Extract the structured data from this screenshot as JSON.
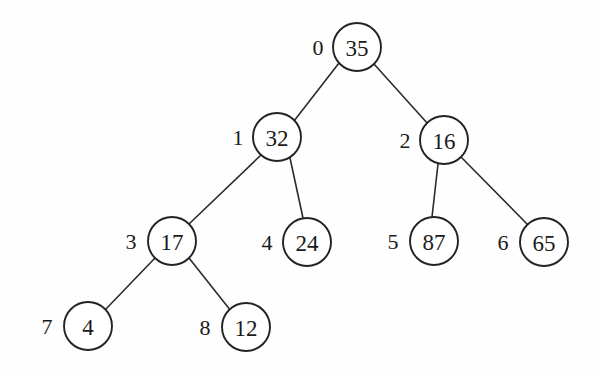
{
  "diagram": {
    "type": "binary-tree",
    "background_color": "#fefefe",
    "node_fill": "#ffffff",
    "node_stroke": "#232323",
    "edge_stroke": "#2b2b2b",
    "text_color": "#1a1a1a",
    "node_radius": 24
  },
  "nodes": [
    {
      "index": "0",
      "value": "35",
      "cx": 357,
      "cy": 47,
      "label_x": 318,
      "label_y": 47
    },
    {
      "index": "1",
      "value": "32",
      "cx": 277,
      "cy": 137,
      "label_x": 238,
      "label_y": 137
    },
    {
      "index": "2",
      "value": "16",
      "cx": 444,
      "cy": 140,
      "label_x": 405,
      "label_y": 140
    },
    {
      "index": "3",
      "value": "17",
      "cx": 172,
      "cy": 241,
      "label_x": 131,
      "label_y": 241
    },
    {
      "index": "4",
      "value": "24",
      "cx": 307,
      "cy": 242,
      "label_x": 267,
      "label_y": 242
    },
    {
      "index": "5",
      "value": "87",
      "cx": 434,
      "cy": 241,
      "label_x": 393,
      "label_y": 241
    },
    {
      "index": "6",
      "value": "65",
      "cx": 544,
      "cy": 242,
      "label_x": 503,
      "label_y": 242
    },
    {
      "index": "7",
      "value": "4",
      "cx": 88,
      "cy": 326,
      "label_x": 47,
      "label_y": 326
    },
    {
      "index": "8",
      "value": "12",
      "cx": 246,
      "cy": 327,
      "label_x": 205,
      "label_y": 327
    }
  ],
  "edges": [
    {
      "from": "0",
      "to": "1",
      "x1": 339,
      "y1": 63,
      "x2": 294,
      "y2": 121
    },
    {
      "from": "0",
      "to": "2",
      "x1": 374,
      "y1": 64,
      "x2": 428,
      "y2": 124
    },
    {
      "from": "1",
      "to": "3",
      "x1": 261,
      "y1": 155,
      "x2": 189,
      "y2": 224
    },
    {
      "from": "1",
      "to": "4",
      "x1": 290,
      "y1": 158,
      "x2": 303,
      "y2": 218
    },
    {
      "from": "2",
      "to": "5",
      "x1": 438,
      "y1": 164,
      "x2": 432,
      "y2": 217
    },
    {
      "from": "2",
      "to": "6",
      "x1": 461,
      "y1": 157,
      "x2": 528,
      "y2": 225
    },
    {
      "from": "3",
      "to": "7",
      "x1": 155,
      "y1": 258,
      "x2": 105,
      "y2": 310
    },
    {
      "from": "3",
      "to": "8",
      "x1": 189,
      "y1": 258,
      "x2": 231,
      "y2": 311
    }
  ]
}
